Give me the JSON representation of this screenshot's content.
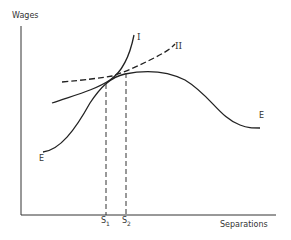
{
  "diagram": {
    "y_axis_label": "Wages",
    "x_axis_label": "Separations",
    "curves": [
      {
        "id": "I",
        "label": "I",
        "style": "solid",
        "description": "steep upward-sloping indifference curve"
      },
      {
        "id": "II",
        "label": "II",
        "style": "dashed",
        "description": "flatter dashed indifference curve"
      },
      {
        "id": "EE",
        "label": "E",
        "style": "solid",
        "description": "employer wage-separation frontier, rising then falling"
      }
    ],
    "curve_E_start_label": "E",
    "curve_E_end_label": "E",
    "markers": [
      {
        "label": "S",
        "subscript": "1"
      },
      {
        "label": "S",
        "subscript": "2"
      }
    ],
    "colors": {
      "line": "#222222",
      "background": "#ffffff"
    }
  }
}
